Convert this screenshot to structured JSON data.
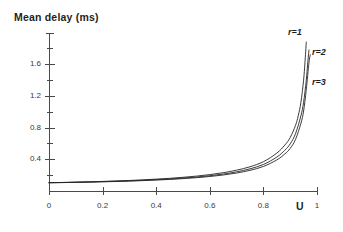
{
  "chart_data": {
    "type": "line",
    "title": "Mean delay (ms)",
    "xlabel": "U",
    "ylabel": "Mean delay (ms)",
    "xlim": [
      0,
      1
    ],
    "ylim": [
      0,
      1.9
    ],
    "grid": false,
    "legend_position": "right-inline",
    "xticks": [
      "0",
      "0.2",
      "0.4",
      "0.6",
      "0.8",
      "1"
    ],
    "xtick_values": [
      0,
      0.2,
      0.4,
      0.6,
      0.8,
      1
    ],
    "yticks": [
      "0.4",
      "0.8",
      "1.2",
      "1.6"
    ],
    "ytick_values": [
      0.4,
      0.8,
      1.2,
      1.6
    ],
    "yminor_values": [
      0.2,
      0.6,
      1.0,
      1.4,
      1.8
    ],
    "line_color": "#262626",
    "axis_color": "#4a4a4a",
    "series": [
      {
        "name": "r=1",
        "label": "r=1",
        "x": [
          0.0,
          0.05,
          0.1,
          0.15,
          0.2,
          0.25,
          0.3,
          0.35,
          0.4,
          0.45,
          0.5,
          0.55,
          0.6,
          0.65,
          0.7,
          0.75,
          0.8,
          0.85,
          0.88,
          0.9,
          0.92,
          0.93,
          0.94,
          0.95,
          0.955,
          0.96
        ],
        "values": [
          0.105,
          0.108,
          0.112,
          0.116,
          0.121,
          0.127,
          0.133,
          0.141,
          0.15,
          0.16,
          0.173,
          0.188,
          0.207,
          0.231,
          0.263,
          0.306,
          0.37,
          0.478,
          0.58,
          0.675,
          0.83,
          0.95,
          1.12,
          1.4,
          1.62,
          1.88
        ]
      },
      {
        "name": "r=2",
        "label": "r=2",
        "x": [
          0.0,
          0.05,
          0.1,
          0.15,
          0.2,
          0.25,
          0.3,
          0.35,
          0.4,
          0.45,
          0.5,
          0.55,
          0.6,
          0.65,
          0.7,
          0.75,
          0.8,
          0.85,
          0.88,
          0.9,
          0.92,
          0.94,
          0.95,
          0.96,
          0.965,
          0.97
        ],
        "values": [
          0.105,
          0.107,
          0.11,
          0.114,
          0.118,
          0.123,
          0.128,
          0.135,
          0.143,
          0.152,
          0.163,
          0.176,
          0.193,
          0.214,
          0.242,
          0.28,
          0.335,
          0.428,
          0.515,
          0.595,
          0.725,
          0.95,
          1.12,
          1.4,
          1.6,
          1.78
        ]
      },
      {
        "name": "r=3",
        "label": "r=3",
        "x": [
          0.0,
          0.05,
          0.1,
          0.15,
          0.2,
          0.25,
          0.3,
          0.35,
          0.4,
          0.45,
          0.5,
          0.55,
          0.6,
          0.65,
          0.7,
          0.75,
          0.8,
          0.85,
          0.88,
          0.9,
          0.92,
          0.94,
          0.95,
          0.96,
          0.97,
          0.975
        ],
        "values": [
          0.105,
          0.106,
          0.109,
          0.112,
          0.116,
          0.12,
          0.125,
          0.131,
          0.138,
          0.146,
          0.156,
          0.168,
          0.183,
          0.202,
          0.227,
          0.261,
          0.31,
          0.392,
          0.468,
          0.538,
          0.652,
          0.855,
          1.01,
          1.28,
          1.62,
          1.72
        ]
      }
    ],
    "series_labels": [
      {
        "text": "r=1",
        "x": 288,
        "y": 27
      },
      {
        "text": "r=2",
        "x": 312,
        "y": 47
      },
      {
        "text": "r=3",
        "x": 312,
        "y": 77
      }
    ]
  }
}
